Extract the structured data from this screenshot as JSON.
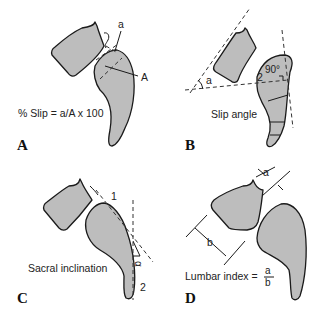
{
  "panels": [
    {
      "id": "A",
      "letter": "A",
      "caption": "% Slip = a/A x 100",
      "labels": {
        "small": "a",
        "large": "A"
      }
    },
    {
      "id": "B",
      "letter": "B",
      "caption": "Slip angle",
      "labels": {
        "angle": "a",
        "right_angle": "90°",
        "vertebra": "2"
      }
    },
    {
      "id": "C",
      "letter": "C",
      "caption": "Sacral inclination",
      "labels": {
        "point1": "1",
        "point2": "2",
        "angle": "α"
      }
    },
    {
      "id": "D",
      "letter": "D",
      "caption": "Lumbar index =",
      "labels": {
        "a": "a",
        "b": "b",
        "numerator": "a",
        "denominator": "b"
      }
    }
  ],
  "colors": {
    "bone_fill": "#bdbdbd",
    "outline": "#1a1a1a",
    "background": "#ffffff"
  }
}
